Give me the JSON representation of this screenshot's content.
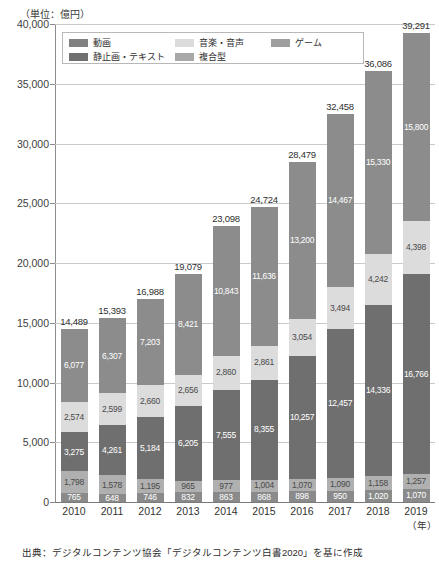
{
  "unit_label": "（単位：億円）",
  "source_note": "出典：デジタルコンテンツ協会「デジタルコンテンツ白書2020」を基に作成",
  "year_axis_unit": "（年）",
  "legend": {
    "items": [
      {
        "label": "動画",
        "color": "#808080"
      },
      {
        "label": "音楽・音声",
        "color": "#dcdcdc"
      },
      {
        "label": "ゲーム",
        "color": "#9e9e9e"
      },
      {
        "label": "静止画・テキスト",
        "color": "#707070"
      },
      {
        "label": "複合型",
        "color": "#a8a8a8"
      }
    ]
  },
  "colors": {
    "video": "#8c8c8c",
    "music_audio": "#dcdcdc",
    "game": "#b0b0b0",
    "still_text": "#6f6f6f",
    "composite": "#8a8a8a",
    "gridline": "#c9c9c9",
    "axis": "#8d8d8d"
  },
  "chart_data": {
    "type": "bar",
    "title": "",
    "xlabel": "（年）",
    "ylabel": "（単位：億円）",
    "ylim": [
      0,
      40000
    ],
    "ytick_step": 5000,
    "yticks": [
      "0",
      "5,000",
      "10,000",
      "15,000",
      "20,000",
      "25,000",
      "30,000",
      "35,000",
      "40,000"
    ],
    "grid": true,
    "stacked": true,
    "legend_position": "top-inside",
    "categories": [
      "2010",
      "2011",
      "2012",
      "2013",
      "2014",
      "2015",
      "2016",
      "2017",
      "2018",
      "2019"
    ],
    "totals": [
      14489,
      15393,
      16988,
      19079,
      23098,
      24724,
      28479,
      32458,
      36086,
      39291
    ],
    "total_labels": [
      "14,489",
      "15,393",
      "16,988",
      "19,079",
      "23,098",
      "24,724",
      "28,479",
      "32,458",
      "36,086",
      "39,291"
    ],
    "series": [
      {
        "name": "複合型",
        "key": "composite",
        "color": "#8a8a8a",
        "values": [
          765,
          648,
          746,
          832,
          863,
          868,
          898,
          950,
          1020,
          1070
        ],
        "labels": [
          "765",
          "648",
          "746",
          "832",
          "863",
          "868",
          "898",
          "950",
          "1,020",
          "1,070"
        ],
        "label_color": "light"
      },
      {
        "name": "ゲーム",
        "key": "game",
        "color": "#b0b0b0",
        "values": [
          1798,
          1578,
          1195,
          965,
          977,
          1004,
          1070,
          1090,
          1158,
          1257
        ],
        "labels": [
          "1,798",
          "1,578",
          "1,195",
          "965",
          "977",
          "1,004",
          "1,070",
          "1,090",
          "1,158",
          "1,257"
        ],
        "label_color": "dark"
      },
      {
        "name": "静止画・テキスト",
        "key": "still_text",
        "color": "#6f6f6f",
        "values": [
          3275,
          4261,
          5184,
          6205,
          7555,
          8355,
          10257,
          12457,
          14336,
          16766
        ],
        "labels": [
          "3,275",
          "4,261",
          "5,184",
          "6,205",
          "7,555",
          "8,355",
          "10,257",
          "12,457",
          "14,336",
          "16,766"
        ],
        "label_color": "light"
      },
      {
        "name": "音楽・音声",
        "key": "music_audio",
        "color": "#dcdcdc",
        "values": [
          2574,
          2599,
          2660,
          2656,
          2860,
          2861,
          3054,
          3494,
          4242,
          4398
        ],
        "labels": [
          "2,574",
          "2,599",
          "2,660",
          "2,656",
          "2,860",
          "2,861",
          "3,054",
          "3,494",
          "4,242",
          "4,398"
        ],
        "label_color": "dark"
      },
      {
        "name": "動画",
        "key": "video",
        "color": "#8c8c8c",
        "values": [
          6077,
          6307,
          7203,
          8421,
          10843,
          11636,
          13200,
          14467,
          15330,
          15800
        ],
        "labels": [
          "6,077",
          "6,307",
          "7,203",
          "8,421",
          "10,843",
          "11,636",
          "13,200",
          "14,467",
          "15,330",
          "15,800"
        ],
        "label_color": "light"
      }
    ]
  }
}
